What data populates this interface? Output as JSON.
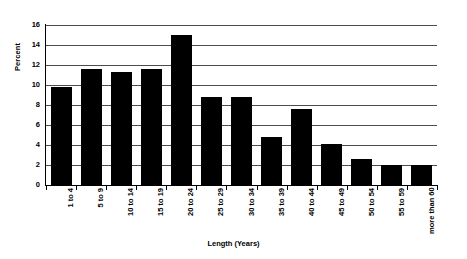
{
  "chart_data": {
    "type": "bar",
    "title": "",
    "subtitle": "",
    "xlabel": "Length (Years)",
    "ylabel": "Percent",
    "categories": [
      "1 to 4",
      "5 to 9",
      "10 to 14",
      "15 to 19",
      "20 to 24",
      "25 to 29",
      "30 to 34",
      "35 to 39",
      "40 to 44",
      "45 to 49",
      "50 to 54",
      "55 to 59",
      "more than 60"
    ],
    "values": [
      9.8,
      11.6,
      11.3,
      11.6,
      15.0,
      8.8,
      8.8,
      4.8,
      7.6,
      4.1,
      2.6,
      2.0,
      2.0
    ],
    "ylim": [
      0,
      16
    ],
    "yticks": [
      0,
      2,
      4,
      6,
      8,
      10,
      12,
      14,
      16
    ],
    "ytick_labels": [
      "0",
      "2",
      "4",
      "6",
      "8",
      "10",
      "12",
      "14",
      "16"
    ],
    "grid": true,
    "grid_axis": "y",
    "legend": false,
    "legend_position": "none",
    "bar_color": "#000000",
    "grid_color": "#4d4d4d",
    "axis_color": "#000000",
    "background_color": "#ffffff",
    "xtick_label_rotation": 90
  }
}
